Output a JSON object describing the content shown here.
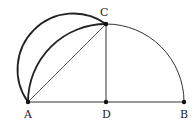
{
  "diagram": {
    "type": "geometry",
    "points": [
      {
        "id": "A",
        "label": "A"
      },
      {
        "id": "D",
        "label": "D"
      },
      {
        "id": "B",
        "label": "B"
      },
      {
        "id": "C",
        "label": "C"
      }
    ],
    "segments": [
      "AB",
      "DC",
      "AC"
    ],
    "arcs": [
      "big-semicircle-AB (center D)",
      "semicircle-on-AC (outward)"
    ],
    "colors": {
      "stroke": "#222222",
      "background": "#ffffff"
    }
  }
}
